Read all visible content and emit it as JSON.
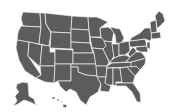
{
  "map": {
    "title": "United States map",
    "fill_color": "#5c5c5c",
    "border_color": "#f4f4f4",
    "background_color": "#ffffff",
    "regions": [
      "contiguous-us",
      "alaska",
      "hawaii"
    ]
  }
}
